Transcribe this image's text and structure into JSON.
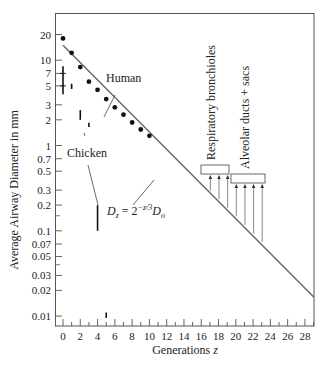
{
  "chart_data": {
    "type": "scatter",
    "title": "",
    "xlabel": "Generations z",
    "ylabel": "Average Airway Diameter in mm",
    "xlim": [
      -1,
      29.5
    ],
    "ylim": [
      0.008,
      35
    ],
    "yscale": "log",
    "grid": false,
    "x_ticks": [
      0,
      2,
      4,
      6,
      8,
      10,
      12,
      14,
      16,
      18,
      20,
      22,
      24,
      26,
      28
    ],
    "x_tick_labels": [
      "0",
      "2",
      "4",
      "6",
      "8",
      "10",
      "12",
      "14",
      "16",
      "18",
      "20",
      "22",
      "24",
      "26",
      "28"
    ],
    "y_ticks": [
      20,
      10,
      7,
      5,
      3,
      2,
      1,
      0.7,
      0.5,
      0.3,
      0.2,
      0.1,
      0.07,
      0.05,
      0.03,
      0.02,
      0.01
    ],
    "y_tick_labels": [
      "20",
      "10",
      "7",
      "5",
      "3",
      "2",
      "1",
      "0.7",
      "0.5",
      "0.3",
      "0.2",
      "0.1",
      "0.07",
      "0.05",
      "0.03",
      "0.02",
      "0.01"
    ],
    "series": [
      {
        "name": "Human",
        "type": "scatter",
        "x": [
          0,
          1,
          2,
          3,
          4,
          5,
          6,
          7,
          8,
          9,
          10
        ],
        "y": [
          18,
          12.2,
          8.3,
          5.6,
          4.5,
          3.5,
          2.8,
          2.3,
          1.86,
          1.54,
          1.3
        ]
      },
      {
        "name": "Chicken",
        "type": "range-bars",
        "x": [
          0,
          1,
          2,
          3,
          4,
          5
        ],
        "y_low": [
          4.0,
          4.6,
          2.0,
          1.65,
          0.1,
          0.0095
        ],
        "y_high": [
          8.5,
          5.3,
          2.6,
          1.85,
          0.2,
          0.011
        ]
      },
      {
        "name": "Model D_z = 2^(-z/3) D_0",
        "type": "line",
        "x": [
          0,
          29.5
        ],
        "y": [
          15,
          0.0166
        ]
      }
    ],
    "annotations": [
      {
        "text": "Human",
        "points_to": "human data"
      },
      {
        "text": "Chicken",
        "points_to": "chicken data at z=4"
      },
      {
        "text": "D_z = 2^(-z/3) D_0",
        "points_to": "model line"
      },
      {
        "text": "Respiratory bronchioles",
        "generations": [
          17,
          18,
          19
        ]
      },
      {
        "text": "Alveolar ducts + sacs",
        "generations": [
          20,
          21,
          22,
          23
        ]
      }
    ]
  },
  "labels": {
    "ylabel": "Average Airway Diameter in mm",
    "xlabel_main": "Generations ",
    "xlabel_var": "z",
    "human": "Human",
    "chicken": "Chicken",
    "formula_D": "D",
    "formula_sub_z": "z",
    "formula_eq": " = 2",
    "formula_exp": "−z/3",
    "formula_D0": "D",
    "formula_sub_0": "o",
    "resp": "Respiratory bronchioles",
    "alv": "Alveolar ducts + sacs"
  }
}
